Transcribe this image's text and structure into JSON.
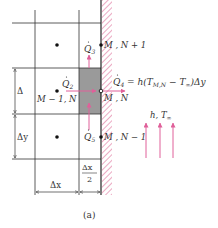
{
  "figure": {
    "caption": "(a)",
    "colors": {
      "grid": "#333333",
      "shaded_cell": "#9a9a9a",
      "arrows": "#e0609a",
      "wall_hatch": "#e07aa0",
      "node": "#111111"
    }
  },
  "nodes": {
    "upper_right": {
      "label": "M , N + 1"
    },
    "center": {
      "label": "M , N"
    },
    "lower_right": {
      "label": "M , N − 1"
    },
    "left": {
      "label": "M − 1, N"
    }
  },
  "heat_flows": {
    "q2": {
      "symbol": "Q",
      "sub": "2"
    },
    "q3": {
      "symbol": "Q",
      "sub": "3"
    },
    "q5": {
      "symbol": "Q",
      "sub": "5"
    },
    "q4": {
      "symbol": "Q",
      "sub": "4",
      "equation_lhs_eq": " = h(",
      "T1": "T",
      "T1_sub": "M,N",
      "minus": " − ",
      "T2": "T",
      "T2_sub": "∞",
      "tail": ")Δy"
    }
  },
  "convection": {
    "h": "h",
    "sep": ", ",
    "T": "T",
    "T_sub": "∞"
  },
  "dimensions": {
    "delta_top": "Δ",
    "delta_y": "Δy",
    "delta_x": "Δx",
    "half_dx_num": "Δx",
    "half_dx_den": "2"
  }
}
